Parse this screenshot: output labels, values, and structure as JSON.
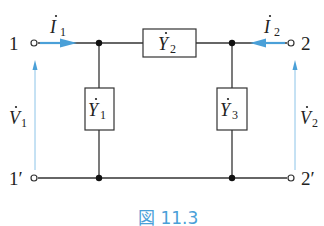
{
  "diagram": {
    "type": "pi-network two-port circuit",
    "terminals": {
      "t1": "1",
      "t1p": "1′",
      "t2": "2",
      "t2p": "2′"
    },
    "currents": {
      "i1": {
        "symbol": "I",
        "sub": "1"
      },
      "i2": {
        "symbol": "I",
        "sub": "2"
      }
    },
    "voltages": {
      "v1": {
        "symbol": "V",
        "sub": "1"
      },
      "v2": {
        "symbol": "V",
        "sub": "2"
      }
    },
    "admittances": {
      "y1": {
        "symbol": "Y",
        "sub": "1"
      },
      "y2": {
        "symbol": "Y",
        "sub": "2"
      },
      "y3": {
        "symbol": "Y",
        "sub": "3"
      }
    },
    "caption": "図 11.3",
    "colors": {
      "wire": "#333333",
      "arrow": "#4aa0d8",
      "caption": "#4aa0d8"
    }
  }
}
